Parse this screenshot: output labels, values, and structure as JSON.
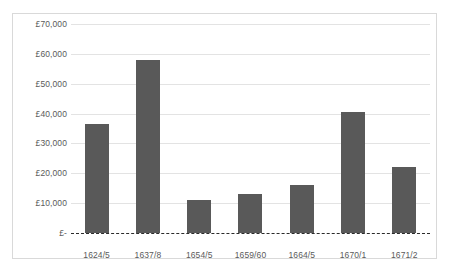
{
  "chart_data": {
    "type": "bar",
    "title": "",
    "subtitle": "",
    "xlabel": "",
    "ylabel": "",
    "categories": [
      "1624/5",
      "1637/8",
      "1654/5",
      "1659/60",
      "1664/5",
      "1670/1",
      "1671/2"
    ],
    "values": [
      36500,
      58000,
      11000,
      13000,
      16000,
      40500,
      22000
    ],
    "ylim": [
      0,
      70000
    ],
    "y_ticks": [
      0,
      10000,
      20000,
      30000,
      40000,
      50000,
      60000,
      70000
    ],
    "y_tick_labels": [
      "£-",
      "£10,000",
      "£20,000",
      "£30,000",
      "£40,000",
      "£50,000",
      "£60,000",
      "£70,000"
    ],
    "grid": true,
    "grid_axis": "y",
    "legend": false,
    "legend_position": "none",
    "series": [
      {
        "name": "",
        "values": [
          36500,
          58000,
          11000,
          13000,
          16000,
          40500,
          22000
        ]
      }
    ],
    "annotations": [],
    "colors": {
      "bar": "#595959",
      "gridline": "#e3e3e3",
      "zero_axis": "#2b2b2b",
      "border": "#d9d9d9",
      "text": "#5a5a5a",
      "background": "#ffffff"
    }
  }
}
